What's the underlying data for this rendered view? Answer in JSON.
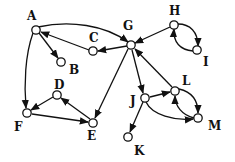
{
  "diagram": {
    "type": "directed-graph",
    "nodes": [
      {
        "id": "A",
        "x": 36,
        "y": 30,
        "lx": 27,
        "ly": 20
      },
      {
        "id": "B",
        "x": 61,
        "y": 62,
        "lx": 69,
        "ly": 74
      },
      {
        "id": "C",
        "x": 93,
        "y": 51,
        "lx": 89,
        "ly": 42
      },
      {
        "id": "G",
        "x": 131,
        "y": 45,
        "lx": 123,
        "ly": 30
      },
      {
        "id": "H",
        "x": 174,
        "y": 25,
        "lx": 169,
        "ly": 15
      },
      {
        "id": "I",
        "x": 197,
        "y": 50,
        "lx": 203,
        "ly": 66
      },
      {
        "id": "D",
        "x": 57,
        "y": 95,
        "lx": 54,
        "ly": 89
      },
      {
        "id": "F",
        "x": 27,
        "y": 113,
        "lx": 14,
        "ly": 131
      },
      {
        "id": "E",
        "x": 93,
        "y": 123,
        "lx": 87,
        "ly": 140
      },
      {
        "id": "J",
        "x": 145,
        "y": 98,
        "lx": 130,
        "ly": 105
      },
      {
        "id": "L",
        "x": 175,
        "y": 91,
        "lx": 182,
        "ly": 85
      },
      {
        "id": "M",
        "x": 198,
        "y": 118,
        "lx": 208,
        "ly": 130
      },
      {
        "id": "K",
        "x": 128,
        "y": 137,
        "lx": 134,
        "ly": 155
      }
    ],
    "edges": [
      {
        "from": "A",
        "to": "G",
        "path": "M38,27 C70,20 105,25 128,42"
      },
      {
        "from": "A",
        "to": "B",
        "path": "M39,33 L58,58"
      },
      {
        "from": "C",
        "to": "A",
        "path": "M89,50 L41,32"
      },
      {
        "from": "G",
        "to": "C",
        "path": "M127,46 L98,51"
      },
      {
        "from": "H",
        "to": "G",
        "path": "M170,27 L135,43"
      },
      {
        "from": "H",
        "to": "I",
        "path": "M178,24 C190,24 198,32 198,46"
      },
      {
        "from": "I",
        "to": "H",
        "path": "M193,51 C180,50 173,42 174,29"
      },
      {
        "from": "A",
        "to": "F",
        "path": "M33,33 C25,55 24,85 26,108"
      },
      {
        "from": "D",
        "to": "F",
        "path": "M53,97 L31,110"
      },
      {
        "from": "F",
        "to": "E",
        "path": "M32,114 L88,122"
      },
      {
        "from": "E",
        "to": "D",
        "path": "M90,119 L61,98"
      },
      {
        "from": "G",
        "to": "E",
        "path": "M128,49 L95,118"
      },
      {
        "from": "G",
        "to": "J",
        "path": "M132,50 L143,93"
      },
      {
        "from": "L",
        "to": "G",
        "path": "M172,87 L135,49"
      },
      {
        "from": "J",
        "to": "L",
        "path": "M150,97 L170,92"
      },
      {
        "from": "L",
        "to": "M",
        "path": "M179,89 C192,92 198,100 198,113"
      },
      {
        "from": "M",
        "to": "L",
        "path": "M194,118 C182,115 175,106 175,96"
      },
      {
        "from": "J",
        "to": "M",
        "path": "M146,102 C152,115 175,121 193,119"
      },
      {
        "from": "J",
        "to": "K",
        "path": "M143,102 L130,132"
      }
    ]
  }
}
